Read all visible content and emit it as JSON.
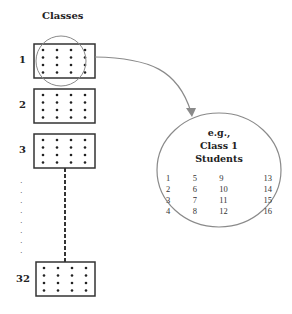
{
  "diagram": {
    "title": "Classes",
    "classes": [
      {
        "label": "1",
        "top": 44
      },
      {
        "label": "2",
        "top": 89
      },
      {
        "label": "3",
        "top": 134
      },
      {
        "label": "32",
        "top": 262
      }
    ],
    "ellipsis": "· · · · · · · ·",
    "dots_per_class": {
      "rows": 4,
      "cols": 4
    },
    "callout": {
      "line1": "e.g.,",
      "line2": "Class 1",
      "line3": "Students",
      "students": [
        [
          "1",
          "5",
          "9",
          "13"
        ],
        [
          "2",
          "6",
          "10",
          "14"
        ],
        [
          "3",
          "7",
          "11",
          "15"
        ],
        [
          "4",
          "8",
          "12",
          "16"
        ]
      ]
    },
    "colors": {
      "box_stroke": "#333333",
      "circle_stroke": "#8a8a8a",
      "arrow": "#8a8a8a"
    }
  }
}
